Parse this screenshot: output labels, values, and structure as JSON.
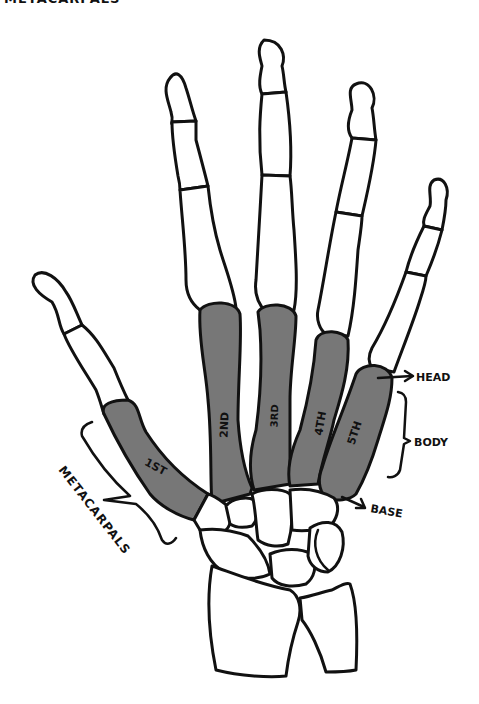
{
  "title_cut_off": "METACARPALS",
  "colors": {
    "metacarpal_fill": "#777777",
    "bone_fill": "#ffffff",
    "outline": "#111111",
    "background": "#ffffff"
  },
  "metacarpals": [
    {
      "label": "1ST"
    },
    {
      "label": "2ND"
    },
    {
      "label": "3RD"
    },
    {
      "label": "4TH"
    },
    {
      "label": "5TH"
    }
  ],
  "annotations": {
    "head": "HEAD",
    "body": "BODY",
    "base": "BASE",
    "group": "METACARPALS"
  }
}
